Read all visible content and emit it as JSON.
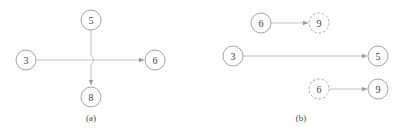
{
  "panels": [
    {
      "caption": "(a)",
      "nodes": [
        {
          "id": "a3",
          "label": "3",
          "style": "solid"
        },
        {
          "id": "a5",
          "label": "5",
          "style": "solid"
        },
        {
          "id": "a6",
          "label": "6",
          "style": "solid"
        },
        {
          "id": "a8",
          "label": "8",
          "style": "solid"
        }
      ],
      "edges": [
        {
          "from": "3",
          "to": "6",
          "note": "horizontal arrow"
        },
        {
          "from": "5",
          "to": "8",
          "note": "vertical arrow with hop-over crossing"
        }
      ]
    },
    {
      "caption": "(b)",
      "nodes": [
        {
          "id": "b6top",
          "label": "6",
          "style": "solid"
        },
        {
          "id": "b9top",
          "label": "9",
          "style": "dashed"
        },
        {
          "id": "b3",
          "label": "3",
          "style": "solid"
        },
        {
          "id": "b5",
          "label": "5",
          "style": "solid"
        },
        {
          "id": "b6bot",
          "label": "6",
          "style": "dashed"
        },
        {
          "id": "b9bot",
          "label": "9",
          "style": "solid"
        }
      ],
      "edges": [
        {
          "from": "6",
          "to": "9 (dashed)"
        },
        {
          "from": "3",
          "to": "5"
        },
        {
          "from": "6 (dashed)",
          "to": "9"
        }
      ]
    }
  ],
  "colors": {
    "stroke": "#9a9a9a",
    "edge": "#b0b0b0",
    "text": "#444444"
  }
}
